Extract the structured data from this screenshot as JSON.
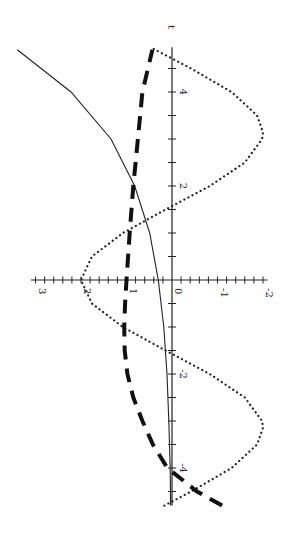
{
  "chart_data": {
    "type": "line",
    "title": "",
    "orientation": "rotated 90° counter-clockwise (t axis vertical, pointing up)",
    "xlabel": "t",
    "ylabel": "",
    "xlim": [
      -4.8,
      4.95
    ],
    "ylim": [
      -2.2,
      3.4
    ],
    "x_ticks": [
      -4,
      -2,
      2,
      4
    ],
    "x_tick_labels": [
      "-4",
      "-2",
      "2",
      "4"
    ],
    "y_ticks": [
      -2,
      -1,
      0,
      1,
      2,
      3
    ],
    "y_tick_labels": [
      "-2",
      "-1",
      "0",
      "1",
      "2",
      "3"
    ],
    "grid": false,
    "legend": null,
    "series": [
      {
        "name": "solid",
        "style": "solid",
        "x": [
          -4.8,
          -4,
          -3,
          -2,
          -1,
          0,
          1,
          2,
          3,
          4,
          4.9
        ],
        "values": [
          0.03,
          0.04,
          0.07,
          0.11,
          0.18,
          0.3,
          0.49,
          0.82,
          1.34,
          2.22,
          3.4
        ]
      },
      {
        "name": "dotted",
        "style": "dotted",
        "x": [
          -4.8,
          -4.5,
          -4,
          -3.5,
          -3.14,
          -3,
          -2.5,
          -2,
          -1.5,
          -1,
          -0.5,
          0,
          0.5,
          1,
          1.5,
          2,
          2.5,
          3,
          3.14,
          3.5,
          4,
          4.5,
          4.95
        ],
        "values": [
          0.17,
          -0.42,
          -1.31,
          -1.87,
          -2.0,
          -1.98,
          -1.6,
          -0.83,
          0.14,
          1.08,
          1.76,
          2.0,
          1.76,
          1.08,
          0.14,
          -0.83,
          -1.6,
          -1.98,
          -2.0,
          -1.87,
          -1.31,
          -0.42,
          0.47
        ]
      },
      {
        "name": "dashed",
        "style": "dashed",
        "x": [
          -4.8,
          -4.5,
          -4,
          -3.5,
          -3,
          -2.5,
          -2,
          -1.5,
          -1,
          -0.5,
          0,
          1,
          2,
          3,
          4,
          4.9
        ],
        "values": [
          -1.1,
          -0.55,
          0.1,
          0.42,
          0.65,
          0.85,
          0.98,
          1.04,
          1.05,
          1.03,
          1.0,
          0.93,
          0.85,
          0.75,
          0.65,
          0.43
        ]
      }
    ]
  },
  "axes": {
    "t_label": "t",
    "t_tick_labels": [
      {
        "t": 4,
        "text": "4"
      },
      {
        "t": 2,
        "text": "2"
      },
      {
        "t": -2,
        "text": "-2"
      },
      {
        "t": -4,
        "text": "-4"
      }
    ],
    "v_tick_labels": [
      {
        "v": 3,
        "text": "3"
      },
      {
        "v": 2,
        "text": "2"
      },
      {
        "v": 1,
        "text": "1"
      },
      {
        "v": 0,
        "text": "0"
      },
      {
        "v": -1,
        "text": "-1"
      },
      {
        "v": -2,
        "text": "-2"
      }
    ]
  }
}
